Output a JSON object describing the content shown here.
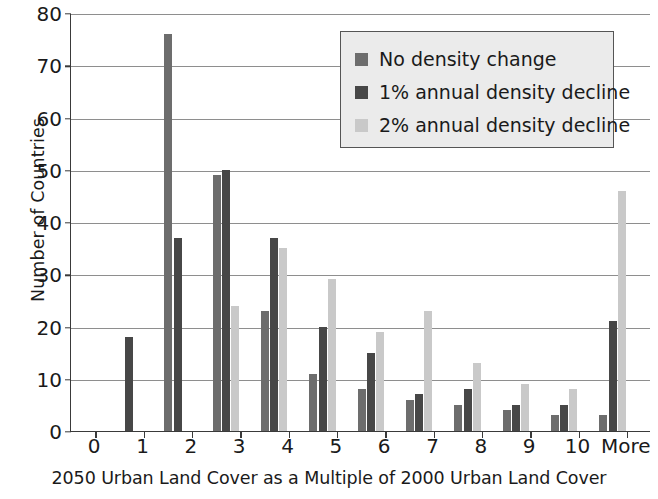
{
  "chart_data": {
    "type": "bar",
    "title": "",
    "xlabel": "2050 Urban Land Cover as a Multiple of 2000 Urban Land Cover",
    "ylabel": "Number of Countries",
    "categories": [
      "0",
      "1",
      "2",
      "3",
      "4",
      "5",
      "6",
      "7",
      "8",
      "9",
      "10",
      "More"
    ],
    "ylim": [
      0,
      80
    ],
    "yticks": [
      0,
      10,
      20,
      30,
      40,
      50,
      60,
      70,
      80
    ],
    "grid": "horizontal",
    "legend_position": "upper-right",
    "series": [
      {
        "name": "No density change",
        "color": "#6d6d6d",
        "values": [
          0,
          0,
          76,
          49,
          23,
          11,
          8,
          6,
          5,
          4,
          3,
          3
        ]
      },
      {
        "name": "1% annual density decline",
        "color": "#474747",
        "values": [
          0,
          18,
          37,
          50,
          37,
          20,
          15,
          7,
          8,
          5,
          5,
          21
        ]
      },
      {
        "name": "2% annual density decline",
        "color": "#c9c9c9",
        "values": [
          0,
          0,
          0,
          24,
          35,
          29,
          19,
          23,
          13,
          9,
          8,
          46
        ]
      }
    ]
  },
  "axis": {
    "y_title": "Number of Countries",
    "x_title": "2050 Urban Land Cover as a Multiple of 2000 Urban Land Cover"
  },
  "colors": {
    "series_0": "#6d6d6d",
    "series_1": "#474747",
    "series_2": "#c9c9c9",
    "grid": "#8e8e8e",
    "axis": "#3a3a3a",
    "legend_background": "#ebebeb",
    "legend_border": "#555555",
    "plot_background": "#ffffff"
  }
}
